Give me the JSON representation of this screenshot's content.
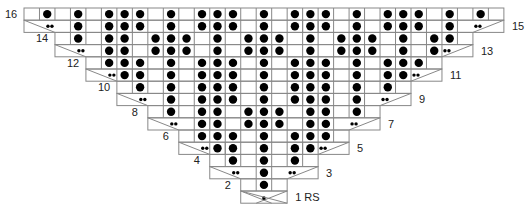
{
  "grid": {
    "cell_w": 15.48,
    "row_h": 12.2,
    "left": 24,
    "top": 8,
    "total_cols": 31,
    "line_color": "#888888",
    "symbol_color": "#000000"
  },
  "row_labels": [
    {
      "row": 16,
      "text": "16",
      "side": "left"
    },
    {
      "row": 15,
      "text": "15",
      "side": "right"
    },
    {
      "row": 14,
      "text": "14",
      "side": "left"
    },
    {
      "row": 13,
      "text": "13",
      "side": "right"
    },
    {
      "row": 12,
      "text": "12",
      "side": "left"
    },
    {
      "row": 11,
      "text": "11",
      "side": "right"
    },
    {
      "row": 10,
      "text": "10",
      "side": "left"
    },
    {
      "row": 9,
      "text": "9",
      "side": "right"
    },
    {
      "row": 8,
      "text": "8",
      "side": "left"
    },
    {
      "row": 7,
      "text": "7",
      "side": "right"
    },
    {
      "row": 6,
      "text": "6",
      "side": "left"
    },
    {
      "row": 5,
      "text": "5",
      "side": "right"
    },
    {
      "row": 4,
      "text": "4",
      "side": "left"
    },
    {
      "row": 3,
      "text": "3",
      "side": "right"
    },
    {
      "row": 2,
      "text": "2",
      "side": "left"
    },
    {
      "row": 1,
      "text": "1 RS",
      "side": "right"
    }
  ],
  "legend_symbols": {
    "D": "knit (large dot)",
    ".": "empty / purl",
    "s": "small dot (decrease center)",
    "b": "double small dot (bobble / twist)"
  },
  "rows": [
    {
      "row": 16,
      "start": 0,
      "cells": ".D.D.DDD.D.DDD.D.DDD.D.DDD.D.D."
    },
    {
      "row": 15,
      "start": 0,
      "cells": "...bD.DDs.D.DsD.D.DsD.DsDD.D.b...",
      "diag": [
        [
          0,
          3,
          "\\"
        ],
        [
          8,
          10,
          "/"
        ],
        [
          12,
          14,
          "\\"
        ],
        [
          16,
          18,
          "/"
        ],
        [
          19,
          21,
          "\\"
        ],
        [
          27,
          31,
          "/"
        ]
      ]
    },
    {
      "row": 14,
      "start": 2,
      "cells": ".D.DD.DDD.D.DDD.D.DDD.D.DD.D."
    },
    {
      "row": 13,
      "start": 2,
      "cells": "..bDD.sDs..D.sDs..DbD.."
    },
    {
      "row": 12,
      "start": 4,
      "cells": ".DDD.D.DDD.D.DDD.D.DDD."
    },
    {
      "row": 11,
      "start": 4,
      "cells": "..bD..s..DD..s..Db.."
    },
    {
      "row": 10,
      "start": 6,
      "cells": ".D.D.DDD.D.DDD.D.D."
    },
    {
      "row": 9,
      "start": 6,
      "cells": "..bD.DDs.D.sDD.Db.."
    },
    {
      "row": 8,
      "start": 8,
      "cells": ".D.DD.DDD.DD.D."
    },
    {
      "row": 7,
      "start": 8,
      "cells": "..bDD.sDs.DDb.."
    },
    {
      "row": 6,
      "start": 10,
      "cells": ".DDD.D.DDD."
    },
    {
      "row": 5,
      "start": 10,
      "cells": "..bD..s..Db.."
    },
    {
      "row": 4,
      "start": 12,
      "cells": ".D.D.D."
    },
    {
      "row": 3,
      "start": 12,
      "cells": "..bDb.."
    },
    {
      "row": 2,
      "start": 14,
      "cells": ".D."
    },
    {
      "row": 1,
      "start": 14,
      "cells": ".s."
    }
  ]
}
